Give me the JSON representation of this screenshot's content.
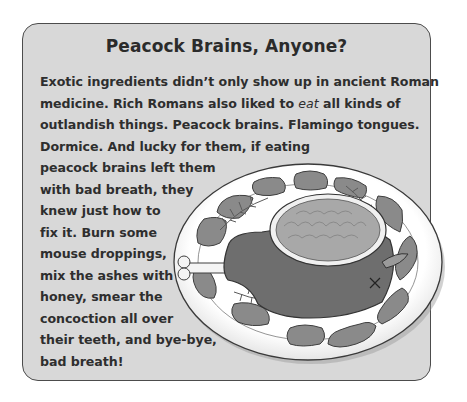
{
  "sidebar": {
    "title": "Peacock Brains, Anyone?",
    "lines": [
      {
        "text": "Exotic ingredients didn’t only show up in ancient Roman"
      },
      {
        "pre": "medicine. Rich Romans also liked to ",
        "emph": "eat",
        "post": " all kinds of"
      },
      {
        "text": "outlandish things. Peacock brains. Flamingo tongues."
      },
      {
        "text": "Dormice. And lucky for them, if eating"
      },
      {
        "text": "peacock brains left them"
      },
      {
        "text": "with bad breath, they"
      },
      {
        "text": "knew just how to"
      },
      {
        "text": "fix it. Burn some"
      },
      {
        "text": "mouse droppings,"
      },
      {
        "text": "mix the ashes with"
      },
      {
        "text": "honey, smear the"
      },
      {
        "text": "concoction all over"
      },
      {
        "text": "their teeth, and bye-bye,"
      },
      {
        "text": "bad breath!"
      }
    ]
  },
  "illustration": {
    "subject": "platter-icon",
    "description": "Oval platter with a roast meat cut topped by a bowl of brains, ringed by flamingo tongues and herb sprigs"
  },
  "colors": {
    "box_bg": "#d8d8d8",
    "box_border": "#4c4c4c",
    "text": "#2e2e2e",
    "meat": "#6e6e6e",
    "tongue": "#8a8a8a",
    "plate": "#ffffff"
  }
}
